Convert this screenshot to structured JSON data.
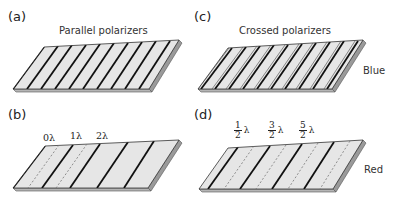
{
  "panels": [
    {
      "id": "a",
      "label": "(a)",
      "title": "Parallel polarizers",
      "side_label": ""
    },
    {
      "id": "b",
      "label": "(b)",
      "title": "",
      "side_label": "",
      "retardation_labels": [
        "0λ",
        "1λ",
        "2λ"
      ]
    },
    {
      "id": "c",
      "label": "(c)",
      "title": "Crossed polarizers",
      "side_label": "Blue"
    },
    {
      "id": "d",
      "label": "(d)",
      "title": "",
      "side_label": "Red",
      "retardation_labels": [
        {
          "num": "1",
          "den": "2",
          "unit": "λ"
        },
        {
          "num": "3",
          "den": "2",
          "unit": "λ"
        },
        {
          "num": "5",
          "den": "2",
          "unit": "λ"
        }
      ]
    }
  ],
  "colors": {
    "slab_top": "#e6e6e6",
    "slab_side": "#9a9a9a",
    "slab_front": "#b5b5b5",
    "stripe": "#111111",
    "dashed": "#777777"
  }
}
